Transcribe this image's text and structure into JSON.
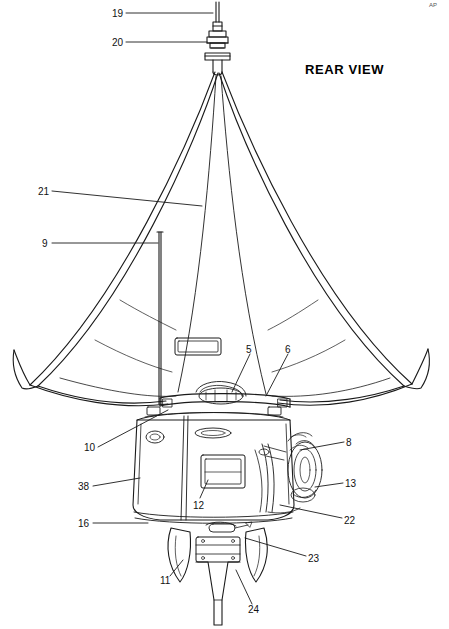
{
  "document": {
    "title": "REAR VIEW",
    "corner_mark": "AP",
    "drawing_type": "patent-line-drawing",
    "subject": "sailing vessel rear view with mast, sail, hull, rudder and outboard components"
  },
  "callouts": [
    {
      "id": "19",
      "label": "19",
      "x": 112,
      "y": 8,
      "leader": [
        [
          126,
          13
        ],
        [
          213,
          13
        ]
      ]
    },
    {
      "id": "20",
      "label": "20",
      "x": 112,
      "y": 37,
      "leader": [
        [
          126,
          42
        ],
        [
          207,
          42
        ]
      ]
    },
    {
      "id": "21",
      "label": "21",
      "x": 38,
      "y": 186,
      "leader": [
        [
          52,
          191
        ],
        [
          202,
          206
        ]
      ]
    },
    {
      "id": "9",
      "label": "9",
      "x": 42,
      "y": 238,
      "leader": [
        [
          52,
          243
        ],
        [
          160,
          243
        ]
      ]
    },
    {
      "id": "5",
      "label": "5",
      "x": 246,
      "y": 344,
      "leader": [
        [
          250,
          354
        ],
        [
          232,
          392
        ]
      ]
    },
    {
      "id": "6",
      "label": "6",
      "x": 285,
      "y": 344,
      "leader": [
        [
          288,
          354
        ],
        [
          266,
          396
        ]
      ]
    },
    {
      "id": "10",
      "label": "10",
      "x": 84,
      "y": 442,
      "leader": [
        [
          98,
          447
        ],
        [
          168,
          410
        ]
      ]
    },
    {
      "id": "8",
      "label": "8",
      "x": 346,
      "y": 437,
      "leader": [
        [
          344,
          442
        ],
        [
          300,
          450
        ]
      ]
    },
    {
      "id": "38",
      "label": "38",
      "x": 78,
      "y": 481,
      "leader": [
        [
          93,
          486
        ],
        [
          140,
          478
        ]
      ]
    },
    {
      "id": "13",
      "label": "13",
      "x": 345,
      "y": 478,
      "leader": [
        [
          343,
          483
        ],
        [
          315,
          487
        ]
      ]
    },
    {
      "id": "12",
      "label": "12",
      "x": 193,
      "y": 500,
      "leader": [
        [
          200,
          498
        ],
        [
          210,
          478
        ]
      ]
    },
    {
      "id": "22",
      "label": "22",
      "x": 344,
      "y": 516,
      "leader": [
        [
          342,
          518
        ],
        [
          280,
          505
        ]
      ]
    },
    {
      "id": "16",
      "label": "16",
      "x": 78,
      "y": 518,
      "leader": [
        [
          93,
          523
        ],
        [
          148,
          523
        ]
      ]
    },
    {
      "id": "23",
      "label": "23",
      "x": 308,
      "y": 556,
      "leader": [
        [
          306,
          556
        ],
        [
          245,
          538
        ]
      ]
    },
    {
      "id": "11",
      "label": "11",
      "x": 160,
      "y": 578,
      "leader": [
        [
          170,
          576
        ],
        [
          183,
          560
        ]
      ]
    },
    {
      "id": "24",
      "label": "24",
      "x": 248,
      "y": 608,
      "leader": [
        [
          252,
          604
        ],
        [
          236,
          570
        ]
      ]
    }
  ]
}
